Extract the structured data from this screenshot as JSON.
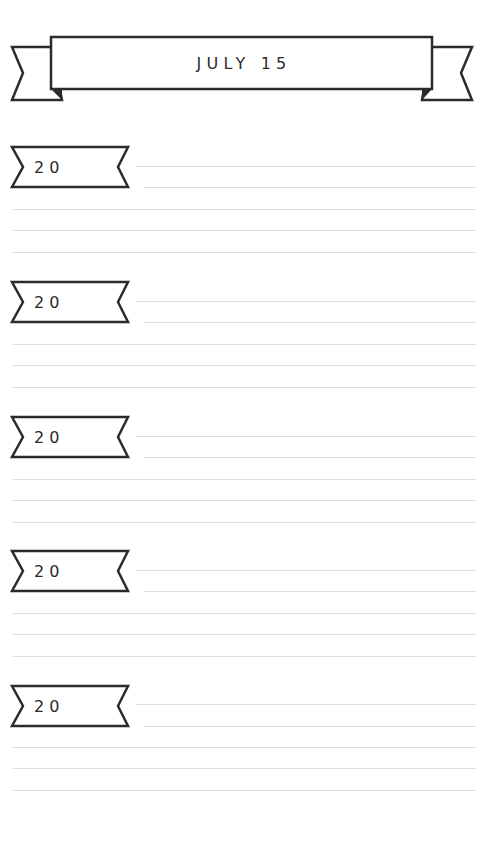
{
  "header": {
    "title": "JULY 15"
  },
  "entries": [
    {
      "year_label": "20",
      "top": 147
    },
    {
      "year_label": "20",
      "top": 282
    },
    {
      "year_label": "20",
      "top": 417
    },
    {
      "year_label": "20",
      "top": 551
    },
    {
      "year_label": "20",
      "top": 686
    }
  ],
  "colors": {
    "ink": "#2b2b2b",
    "rule_line": "#dcdcdc",
    "background": "#ffffff"
  }
}
